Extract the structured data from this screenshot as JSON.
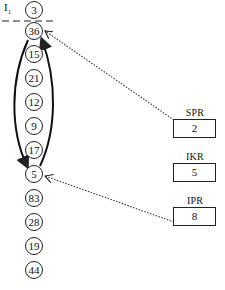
{
  "header": {
    "label": "I",
    "subscript": "1"
  },
  "stack": {
    "nodes": [
      {
        "value": "3",
        "y": 10
      },
      {
        "value": "36",
        "y": 31
      },
      {
        "value": "15",
        "y": 54
      },
      {
        "value": "21",
        "y": 78
      },
      {
        "value": "12",
        "y": 102
      },
      {
        "value": "9",
        "y": 126
      },
      {
        "value": "17",
        "y": 150
      },
      {
        "value": "5",
        "y": 174
      },
      {
        "value": "83",
        "y": 198
      },
      {
        "value": "28",
        "y": 222
      },
      {
        "value": "19",
        "y": 246
      },
      {
        "value": "44",
        "y": 270
      }
    ]
  },
  "registers": [
    {
      "name": "SPR",
      "value": "2"
    },
    {
      "name": "IKR",
      "value": "5"
    },
    {
      "name": "IPR",
      "value": "8"
    }
  ],
  "arrows": {
    "spr_target": "36",
    "ipr_target": "5",
    "loop_from": "36",
    "loop_to": "5"
  },
  "colors": {
    "stroke": "#222222",
    "background": "#ffffff"
  }
}
